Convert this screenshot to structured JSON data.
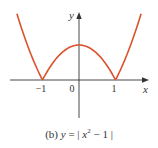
{
  "chart_data": {
    "type": "line",
    "caption": {
      "prefix": "(b) ",
      "y_var": "y",
      "eq": " = | ",
      "x_var": "x",
      "exp": "2",
      "tail": " − 1 |"
    },
    "function": "y = |x^2 - 1|",
    "xlabel": "x",
    "ylabel": "y",
    "xlim": [
      -2.1,
      2.1
    ],
    "ylim": [
      -1.3,
      2.2
    ],
    "grid": false,
    "legend": null,
    "x_ticks": [
      {
        "value": -1,
        "label": "−1"
      },
      {
        "value": 0,
        "label": "0"
      },
      {
        "value": 1,
        "label": "1"
      }
    ],
    "series": [
      {
        "name": "y = |x² − 1|",
        "color": "#d9532c",
        "x": [
          -1.7,
          -1.5,
          -1.25,
          -1.0,
          -0.75,
          -0.5,
          -0.25,
          0.0,
          0.25,
          0.5,
          0.75,
          1.0,
          1.25,
          1.5,
          1.7
        ],
        "y": [
          1.89,
          1.25,
          0.5625,
          0.0,
          0.4375,
          0.75,
          0.9375,
          1.0,
          0.9375,
          0.75,
          0.4375,
          0.0,
          0.5625,
          1.25,
          1.89
        ]
      }
    ],
    "annotations": []
  },
  "colors": {
    "curve": "#d9532c",
    "axis": "#333333",
    "text": "#333333"
  }
}
